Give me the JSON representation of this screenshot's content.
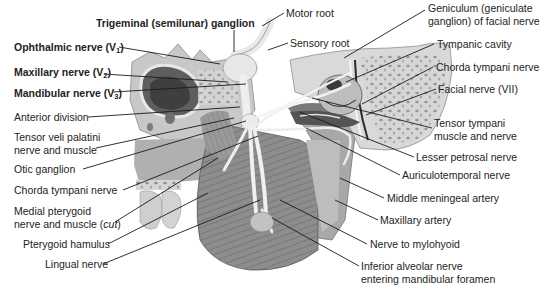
{
  "figure": {
    "type": "anatomical-illustration",
    "palette": {
      "background": "#ffffff",
      "bone_light": "#e2e2e2",
      "bone_mid": "#bdbdbd",
      "bone_dark": "#8a8a8a",
      "muscle": "#9c9c9c",
      "muscle_dark": "#6e6e6e",
      "nerve": "#f2f2f2",
      "leader_line": "#1a1a1a",
      "text": "#232323"
    }
  },
  "labels": {
    "trigeminal_ganglion": "Trigeminal (semilunar) ganglion",
    "ophthalmic": {
      "text": "Ophthalmic nerve (V",
      "sub": "1",
      "close": ")"
    },
    "maxillary_nerve": {
      "text": "Maxillary nerve (V",
      "sub": "2",
      "close": ")"
    },
    "mandibular": {
      "text": "Mandibular nerve (V",
      "sub": "3",
      "close": ")"
    },
    "anterior_division": "Anterior division",
    "tensor_veli_palatini": "Tensor veli palatini\nnerve and muscle",
    "otic_ganglion": "Otic ganglion",
    "chorda_tympani_left": "Chorda tympani nerve",
    "medial_pterygoid_line1": "Medial pterygoid",
    "medial_pterygoid_line2": "nerve and muscle (",
    "medial_pterygoid_cut": "cut",
    "medial_pterygoid_close": ")",
    "pterygoid_hamulus": "Pterygoid hamulus",
    "lingual_nerve": "Lingual nerve",
    "motor_root": "Motor root",
    "sensory_root": "Sensory root",
    "geniculum": "Geniculum (geniculate\nganglion) of facial nerve",
    "tympanic_cavity": "Tympanic cavity",
    "chorda_tympani_right": "Chorda tympani nerve",
    "facial_nerve": "Facial nerve (VII)",
    "tensor_tympani": "Tensor tympani\nmuscle and nerve",
    "lesser_petrosal": "Lesser petrosal nerve",
    "auriculotemporal": "Auriculotemporal nerve",
    "middle_meningeal": "Middle meningeal artery",
    "maxillary_artery": "Maxillary artery",
    "nerve_to_mylohyoid": "Nerve to mylohyoid",
    "inferior_alveolar": "Inferior alveolar nerve\nentering mandibular foramen"
  }
}
